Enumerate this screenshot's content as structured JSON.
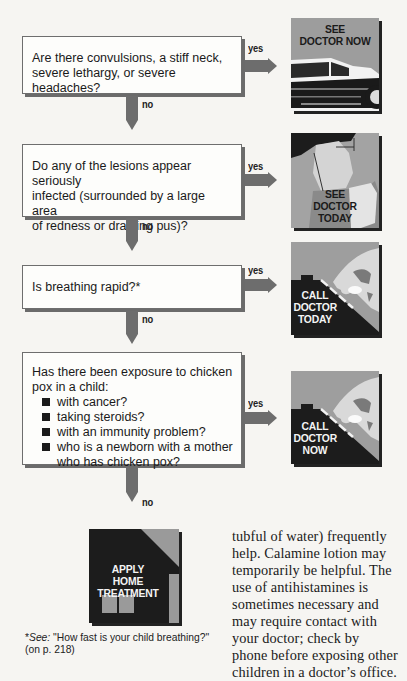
{
  "flowchart": {
    "questions": [
      {
        "text": "Are there convulsions, a stiff neck, severe lethargy, or severe headaches?",
        "lines": [
          "Are there convulsions, a stiff neck,",
          "severe lethargy, or severe headaches?"
        ],
        "yes_label": "yes",
        "no_label": "no",
        "outcome": {
          "label_lines": [
            "SEE",
            "DOCTOR NOW"
          ],
          "icon": "car-icon"
        }
      },
      {
        "text": "Do any of the lesions appear seriously infected (surrounded by a large area of redness or draining pus)?",
        "lines": [
          "Do any of the lesions appear seriously",
          "infected (surrounded by a large area",
          "of redness or draining pus)?"
        ],
        "yes_label": "yes",
        "no_label": "no",
        "outcome": {
          "label_lines": [
            "SEE",
            "DOCTOR",
            "TODAY"
          ],
          "icon": "doctor-examining-icon"
        }
      },
      {
        "text": "Is breathing rapid?*",
        "lines": [
          "Is breathing rapid?*"
        ],
        "yes_label": "yes",
        "no_label": "no",
        "outcome": {
          "label_lines": [
            "CALL",
            "DOCTOR",
            "TODAY"
          ],
          "icon": "phone-dial-icon"
        }
      },
      {
        "text": "Has there been exposure to chicken pox in a child:",
        "lines": [
          "Has there been exposure to chicken",
          "pox in a child:"
        ],
        "bullets": [
          "with cancer?",
          "taking steroids?",
          "with an immunity problem?",
          "who is a newborn with a mother who has chicken pox?"
        ],
        "bullet_4_lines": [
          "who is a newborn with a mother",
          "who has chicken pox?"
        ],
        "yes_label": "yes",
        "no_label": "no",
        "outcome": {
          "label_lines": [
            "CALL",
            "DOCTOR",
            "NOW"
          ],
          "icon": "phone-dial-icon"
        }
      }
    ],
    "final": {
      "label_lines": [
        "APPLY",
        "HOME",
        "TREATMENT"
      ],
      "icon": "house-icon"
    }
  },
  "footnote": {
    "prefix": "*",
    "see": "See:",
    "text": " \"How fast is your child breathing?\"",
    "line2": "(on p. 218)"
  },
  "body_text": {
    "lines": [
      "tubful of water) frequently",
      "help. Calamine lotion may",
      "temporarily be helpful. The",
      "use of antihistamines is",
      "sometimes necessary and",
      "may require contact with",
      "your doctor; check by",
      "phone before exposing other",
      "children in a doctor’s office."
    ]
  },
  "colors": {
    "arrow": "#6d6d6d",
    "box_border": "#6e6e6e",
    "pic_gray": "#9a9a9a",
    "pic_dark": "#1c1c1c"
  }
}
